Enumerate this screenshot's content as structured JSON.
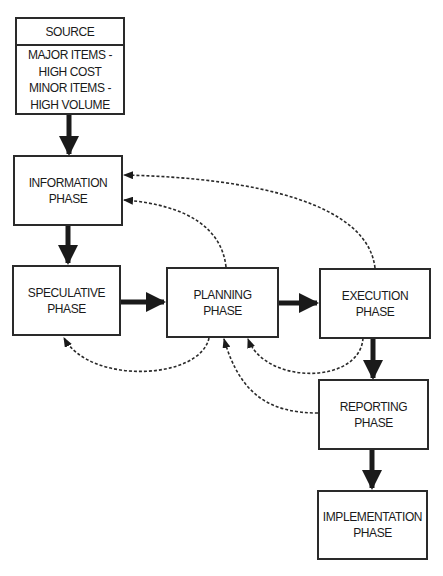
{
  "diagram": {
    "type": "flowchart",
    "colors": {
      "stroke": "#2a2a2a",
      "background": "#ffffff"
    },
    "nodes": {
      "source": {
        "header": "SOURCE",
        "lines": [
          "MAJOR ITEMS -",
          "HIGH COST",
          "MINOR ITEMS -",
          "HIGH VOLUME"
        ]
      },
      "information": {
        "lines": [
          "INFORMATION",
          "PHASE"
        ]
      },
      "speculative": {
        "lines": [
          "SPECULATIVE",
          "PHASE"
        ]
      },
      "planning": {
        "lines": [
          "PLANNING",
          "PHASE"
        ]
      },
      "execution": {
        "lines": [
          "EXECUTION",
          "PHASE"
        ]
      },
      "reporting": {
        "lines": [
          "REPORTING",
          "PHASE"
        ]
      },
      "implementation": {
        "lines": [
          "IMPLEMENTATION",
          "PHASE"
        ]
      }
    },
    "edges": [
      {
        "from": "source",
        "to": "information",
        "style": "solid-bold"
      },
      {
        "from": "information",
        "to": "speculative",
        "style": "solid-bold"
      },
      {
        "from": "speculative",
        "to": "planning",
        "style": "solid-bold"
      },
      {
        "from": "planning",
        "to": "execution",
        "style": "solid-bold"
      },
      {
        "from": "execution",
        "to": "reporting",
        "style": "solid-bold"
      },
      {
        "from": "reporting",
        "to": "implementation",
        "style": "solid-bold"
      },
      {
        "from": "planning",
        "to": "information",
        "style": "dashed-feedback"
      },
      {
        "from": "execution",
        "to": "information",
        "style": "dashed-feedback"
      },
      {
        "from": "planning",
        "to": "speculative",
        "style": "dashed-feedback"
      },
      {
        "from": "execution",
        "to": "planning",
        "style": "dashed-feedback"
      },
      {
        "from": "reporting",
        "to": "planning",
        "style": "dashed-feedback"
      }
    ]
  }
}
